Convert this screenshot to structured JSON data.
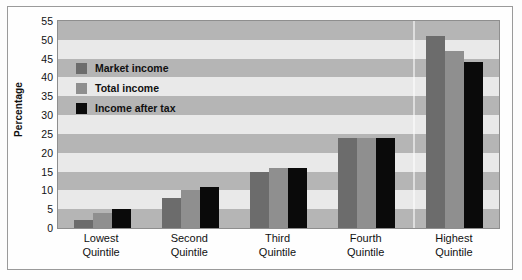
{
  "chart_data": {
    "type": "bar",
    "title": "",
    "xlabel": "",
    "ylabel": "Percentage",
    "ylim": [
      0,
      55
    ],
    "ytick_step": 5,
    "yticks": [
      55,
      50,
      45,
      40,
      35,
      30,
      25,
      20,
      15,
      10,
      5,
      0
    ],
    "grid": "horizontal-bands",
    "legend_position": "inside-upper-left",
    "categories": [
      "Lowest Quintile",
      "Second Quintile",
      "Third Quintile",
      "Fourth Quintile",
      "Highest Quintile"
    ],
    "category_lines": [
      [
        "Lowest",
        "Quintile"
      ],
      [
        "Second",
        "Quintile"
      ],
      [
        "Third",
        "Quintile"
      ],
      [
        "Fourth",
        "Quintile"
      ],
      [
        "Highest",
        "Quintile"
      ]
    ],
    "series": [
      {
        "name": "Market income",
        "color": "#6c6c6c",
        "values": [
          2,
          8,
          15,
          24,
          51
        ]
      },
      {
        "name": "Total income",
        "color": "#8f8f8f",
        "values": [
          4,
          10,
          16,
          24,
          47
        ]
      },
      {
        "name": "Income after tax",
        "color": "#0a0a0a",
        "values": [
          5,
          11,
          16,
          24,
          44
        ]
      }
    ],
    "band_colors": {
      "dark": "#b5b5b5",
      "light": "#e9e9e9"
    },
    "axis_color": "#8e8e8e",
    "frame_color": "#9a9a9a"
  }
}
